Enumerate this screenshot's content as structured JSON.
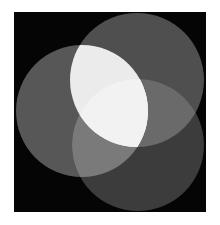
{
  "image": {
    "description": "Three overlapping gray circles on a black square, brightest where they overlap",
    "background_color": "#050505",
    "circles": [
      {
        "name": "top-right",
        "cx": 137,
        "cy": 80,
        "r": 67,
        "color": "#4f4f4f"
      },
      {
        "name": "left",
        "cx": 82,
        "cy": 111,
        "r": 66,
        "color": "#575757"
      },
      {
        "name": "bottom-right",
        "cx": 138,
        "cy": 145,
        "r": 66,
        "color": "#3c3c3c"
      }
    ],
    "overlap_colors": {
      "top_left": "#ebebeb",
      "left_bottom": "#7a7a7a",
      "top_bottom": "#6a6a6a",
      "all_three": "#f2f2f2"
    }
  }
}
